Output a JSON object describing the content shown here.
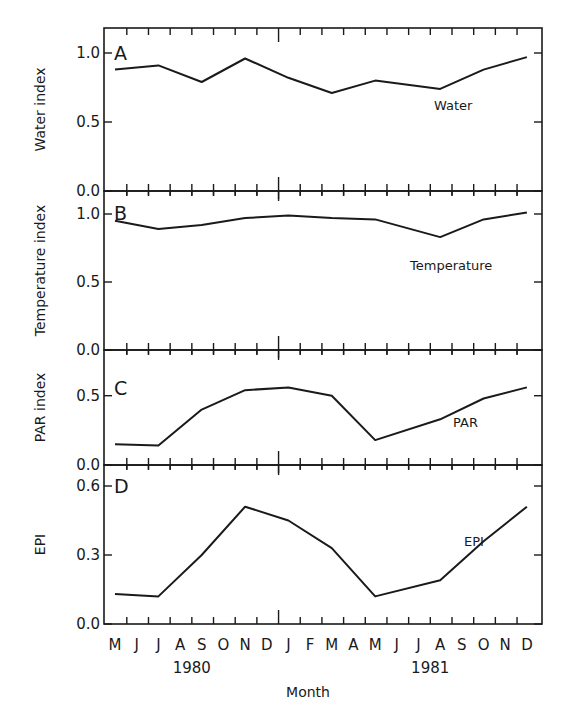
{
  "chart_data": [
    {
      "type": "line",
      "panel": "A",
      "title": "",
      "series_label": "Water",
      "ylabel": "Water index",
      "xlabel": "Month",
      "yticks": [
        "0.0",
        "0.5",
        "1.0"
      ],
      "ytick_values": [
        0.0,
        0.5,
        1.0
      ],
      "ylim": [
        0.0,
        1.18
      ],
      "x": [
        "May 1980",
        "Jul 1980",
        "Sep 1980",
        "Nov 1980",
        "Jan 1981",
        "Mar 1981",
        "May 1981",
        "Aug 1981",
        "Oct 1981",
        "Dec 1981"
      ],
      "x_index": [
        0,
        2,
        4,
        6,
        8,
        10,
        12,
        15,
        17,
        19
      ],
      "values": [
        0.88,
        0.91,
        0.79,
        0.96,
        0.82,
        0.71,
        0.8,
        0.74,
        0.88,
        0.97
      ]
    },
    {
      "type": "line",
      "panel": "B",
      "series_label": "Temperature",
      "ylabel": "Temperature index",
      "xlabel": "Month",
      "yticks": [
        "0.0",
        "0.5",
        "1.0"
      ],
      "ytick_values": [
        0.0,
        0.5,
        1.0
      ],
      "ylim": [
        0.0,
        1.17
      ],
      "x": [
        "May 1980",
        "Jul 1980",
        "Sep 1980",
        "Nov 1980",
        "Jan 1981",
        "Mar 1981",
        "May 1981",
        "Aug 1981",
        "Oct 1981",
        "Dec 1981"
      ],
      "x_index": [
        0,
        2,
        4,
        6,
        8,
        10,
        12,
        15,
        17,
        19
      ],
      "values": [
        0.95,
        0.89,
        0.92,
        0.97,
        0.99,
        0.97,
        0.96,
        0.83,
        0.96,
        1.01
      ]
    },
    {
      "type": "line",
      "panel": "C",
      "series_label": "PAR",
      "ylabel": "PAR index",
      "xlabel": "Month",
      "yticks": [
        "0.0",
        "0.5"
      ],
      "ytick_values": [
        0.0,
        0.5
      ],
      "ylim": [
        0.0,
        0.83
      ],
      "x": [
        "May 1980",
        "Jul 1980",
        "Sep 1980",
        "Nov 1980",
        "Jan 1981",
        "Mar 1981",
        "May 1981",
        "Aug 1981",
        "Oct 1981",
        "Dec 1981"
      ],
      "x_index": [
        0,
        2,
        4,
        6,
        8,
        10,
        12,
        15,
        17,
        19
      ],
      "values": [
        0.15,
        0.14,
        0.4,
        0.54,
        0.56,
        0.5,
        0.18,
        0.33,
        0.48,
        0.56
      ]
    },
    {
      "type": "line",
      "panel": "D",
      "series_label": "EPI",
      "ylabel": "EPI",
      "xlabel": "Month",
      "yticks": [
        "0.0",
        "0.3",
        "0.6"
      ],
      "ytick_values": [
        0.0,
        0.3,
        0.6
      ],
      "ylim": [
        0.0,
        0.69
      ],
      "x": [
        "May 1980",
        "Jul 1980",
        "Sep 1980",
        "Nov 1980",
        "Jan 1981",
        "Mar 1981",
        "May 1981",
        "Aug 1981",
        "Oct 1981",
        "Dec 1981"
      ],
      "x_index": [
        0,
        2,
        4,
        6,
        8,
        10,
        12,
        15,
        17,
        19
      ],
      "values": [
        0.13,
        0.12,
        0.3,
        0.51,
        0.45,
        0.33,
        0.12,
        0.19,
        0.36,
        0.51
      ]
    }
  ],
  "x_axis": {
    "months": [
      "M",
      "J",
      "J",
      "A",
      "S",
      "O",
      "N",
      "D",
      "J",
      "F",
      "M",
      "A",
      "M",
      "J",
      "J",
      "A",
      "S",
      "O",
      "N",
      "D"
    ],
    "years": [
      {
        "label": "1980",
        "center_index": 4
      },
      {
        "label": "1981",
        "center_index": 15
      }
    ],
    "title": "Month",
    "year_boundary_after_index": 7
  },
  "style": {
    "line_color": "#1a1a1a",
    "background": "#ffffff"
  }
}
